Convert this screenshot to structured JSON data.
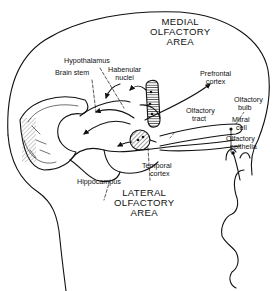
{
  "diagram": {
    "type": "anatomical-line-drawing",
    "colors": {
      "ink": "#111111",
      "background": "#ffffff"
    },
    "labels": {
      "medial_area": [
        "MEDIAL",
        "OLFACTORY",
        "AREA"
      ],
      "lateral_area": [
        "LATERAL",
        "OLFACTORY",
        "AREA"
      ],
      "hypothalamus": "Hypothalamus",
      "brain_stem": "Brain stem",
      "habenular_nuclei": [
        "Habenular",
        "nuclei"
      ],
      "prefrontal_cortex": [
        "Prefrontal",
        "cortex"
      ],
      "olfactory_tract": [
        "Olfactory",
        "tract"
      ],
      "olfactory_bulb": [
        "Olfactory",
        "bulb"
      ],
      "mitral_cell": [
        "Mitral",
        "cell"
      ],
      "olfactory_epithelia": [
        "Olfactory",
        "epithelia"
      ],
      "temporal_cortex": [
        "Temporal",
        "cortex"
      ],
      "hippocampus": "Hippocampus"
    }
  }
}
